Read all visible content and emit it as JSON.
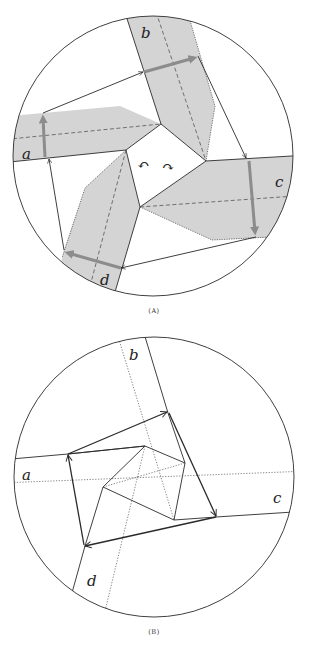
{
  "figure": {
    "panels": [
      {
        "id": "A",
        "caption": "(A)",
        "strip_labels": {
          "a": "a",
          "b": "b",
          "c": "c",
          "d": "d"
        },
        "rotation_symbols": {
          "left": "↶",
          "right": "↷"
        }
      },
      {
        "id": "B",
        "caption": "(B)",
        "strip_labels": {
          "a": "a",
          "b": "b",
          "c": "c",
          "d": "d"
        }
      }
    ]
  },
  "colors": {
    "stroke": "#2a2a2a",
    "shade": "#d4d4d4",
    "gray_arrow": "#8c8c8c",
    "background": "#ffffff"
  }
}
